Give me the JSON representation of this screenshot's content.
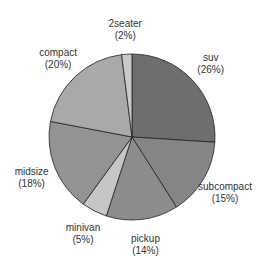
{
  "chart_data": {
    "type": "pie",
    "title": "",
    "start": "top",
    "direction": "clockwise",
    "slices": [
      {
        "label": "suv",
        "value": 26,
        "pct_label": "(26%)",
        "color": "#6e6e6e"
      },
      {
        "label": "subcompact",
        "value": 15,
        "pct_label": "(15%)",
        "color": "#858585"
      },
      {
        "label": "pickup",
        "value": 14,
        "pct_label": "(14%)",
        "color": "#8c8c8c"
      },
      {
        "label": "minivan",
        "value": 5,
        "pct_label": "(5%)",
        "color": "#c6c6c6"
      },
      {
        "label": "midsize",
        "value": 18,
        "pct_label": "(18%)",
        "color": "#939393"
      },
      {
        "label": "compact",
        "value": 20,
        "pct_label": "(20%)",
        "color": "#a9a9a9"
      },
      {
        "label": "2seater",
        "value": 2,
        "pct_label": "(2%)",
        "color": "#c9c9c9"
      }
    ]
  }
}
